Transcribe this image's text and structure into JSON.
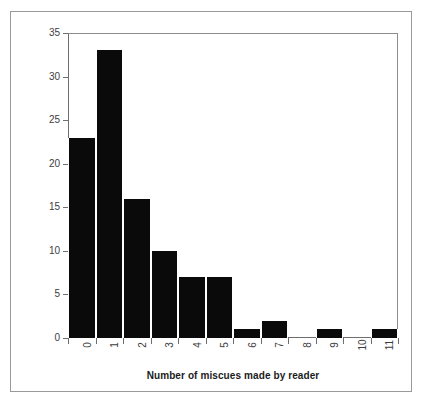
{
  "chart_data": {
    "type": "bar",
    "title": "",
    "subtitle": "",
    "xlabel": "Number of miscues made by reader",
    "ylabel": "",
    "categories": [
      "0",
      "1",
      "2",
      "3",
      "4",
      "5",
      "6",
      "7",
      "8",
      "9",
      "10",
      "11"
    ],
    "values": [
      23,
      33,
      16,
      10,
      7,
      7,
      1,
      2,
      0,
      1,
      0,
      1
    ],
    "series": [
      {
        "name": "Frequency",
        "values": [
          23,
          33,
          16,
          10,
          7,
          7,
          1,
          2,
          0,
          1,
          0,
          1
        ]
      }
    ],
    "ylim": [
      0,
      35
    ],
    "yticks": [
      0,
      5,
      10,
      15,
      20,
      25,
      30,
      35
    ],
    "ytick_labels": [
      "0",
      "5",
      "10",
      "15",
      "20",
      "25",
      "30",
      "35"
    ],
    "xtick_labels": [
      "0",
      "1",
      "2",
      "3",
      "4",
      "5",
      "6",
      "7",
      "8",
      "9",
      "10",
      "11"
    ],
    "xtick_rotation": -90,
    "grid": false,
    "legend": false,
    "legend_position": "none",
    "bar_color": "#0a0a0a",
    "bar_gap_color": "#ffffff",
    "axis_color": "#6e6e6e",
    "frame_color": "#9a9a9a",
    "text_color": "#3d3d3d",
    "background": "#ffffff",
    "annotations": []
  }
}
